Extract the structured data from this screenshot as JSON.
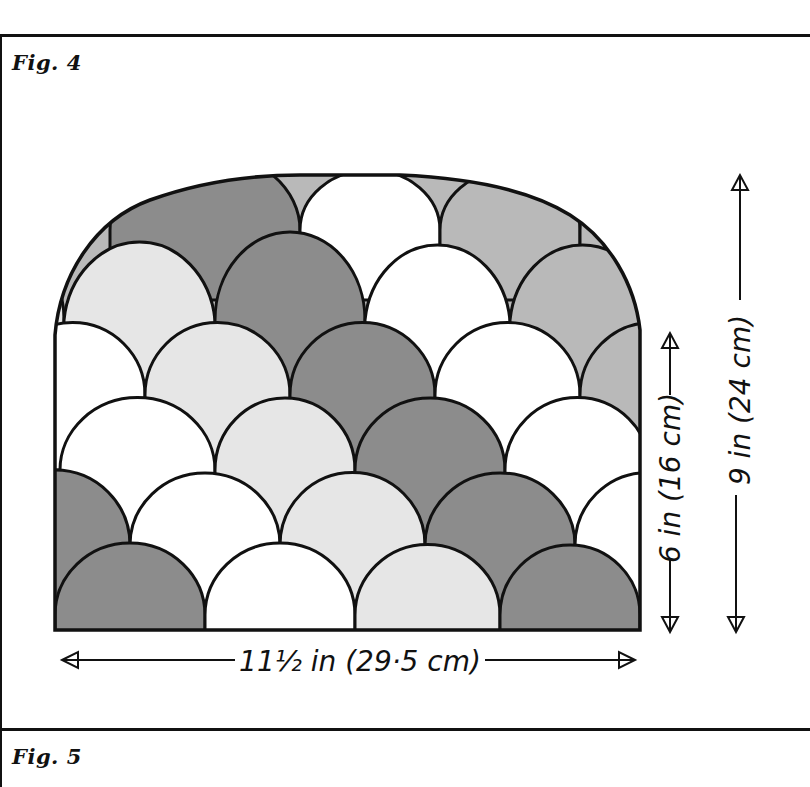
{
  "figures": [
    {
      "label": "Fig. 4"
    },
    {
      "label": "Fig. 5"
    }
  ],
  "diagram": {
    "colors": {
      "dark": "#8c8c8c",
      "mid": "#b9b9b9",
      "light": "#e6e6e6",
      "white": "#ffffff",
      "outline": "#111111"
    },
    "dimensions": {
      "width": "11½ in (29·5 cm)",
      "side_height": "6 in (16 cm)",
      "total_height": "9 in (24 cm)"
    }
  }
}
